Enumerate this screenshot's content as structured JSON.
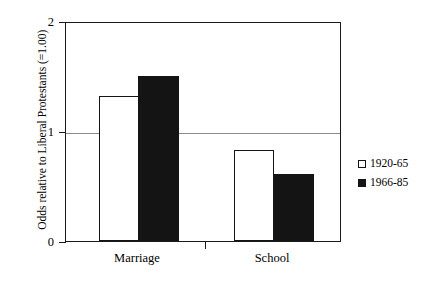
{
  "chart_data": {
    "type": "bar",
    "title": "",
    "subtitle": "",
    "xlabel": "",
    "ylabel": "Odds relative to Liberal Protestants (=1.00)",
    "categories": [
      "Marriage",
      "School"
    ],
    "series": [
      {
        "name": "1920-65",
        "values": [
          1.32,
          0.83
        ],
        "color": "#ffffff",
        "edge_color": "#141414"
      },
      {
        "name": "1966-85",
        "values": [
          1.5,
          0.61
        ],
        "color": "#141414",
        "edge_color": "#141414"
      }
    ],
    "ylim": [
      0,
      2
    ],
    "yticks": [
      0,
      1,
      2
    ],
    "ytick_labels": [
      "0",
      "1",
      "2"
    ],
    "grid": "horizontal-at-1",
    "reference_line": 1.0,
    "legend_position": "right"
  },
  "axis": {
    "y_title": "Odds relative to Liberal Protestants (=1.00)",
    "tick_0": "0",
    "tick_1": "1",
    "tick_2": "2"
  },
  "categories": {
    "marriage": "Marriage",
    "school": "School"
  },
  "legend": {
    "entry_0": "1920-65",
    "entry_1": "1966-85"
  }
}
